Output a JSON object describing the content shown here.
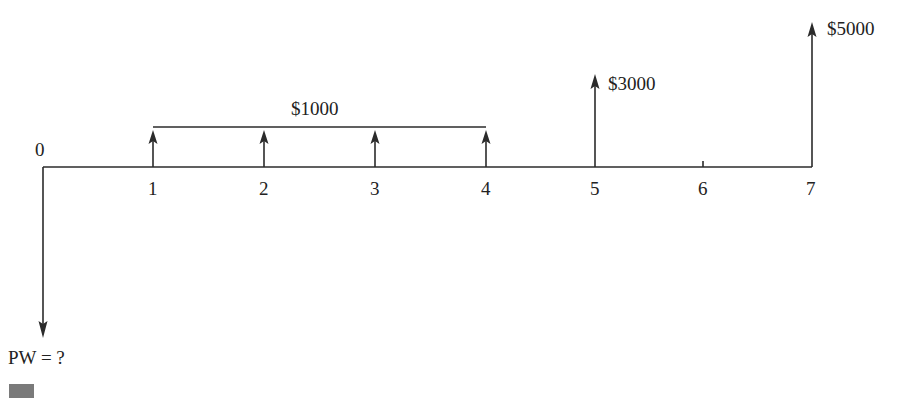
{
  "diagram": {
    "type": "cash-flow-diagram",
    "time_labels": [
      "0",
      "1",
      "2",
      "3",
      "4",
      "5",
      "6",
      "7"
    ],
    "annuity_label": "$1000",
    "cash_flows": [
      {
        "period": 0,
        "direction": "down",
        "label": "PW = ?"
      },
      {
        "period": 1,
        "direction": "up",
        "amount": "$1000"
      },
      {
        "period": 2,
        "direction": "up",
        "amount": "$1000"
      },
      {
        "period": 3,
        "direction": "up",
        "amount": "$1000"
      },
      {
        "period": 4,
        "direction": "up",
        "amount": "$1000"
      },
      {
        "period": 5,
        "direction": "up",
        "label": "$3000"
      },
      {
        "period": 7,
        "direction": "up",
        "label": "$5000"
      }
    ],
    "labels": {
      "t0": "0",
      "t1": "1",
      "t2": "2",
      "t3": "3",
      "t4": "4",
      "t5": "5",
      "t6": "6",
      "t7": "7",
      "annuity": "$1000",
      "flow5": "$3000",
      "flow7": "$5000",
      "pw": "PW = ?"
    },
    "colors": {
      "line": "#2b2b2b",
      "text": "#222222",
      "marker": "#7a7a7a"
    }
  }
}
